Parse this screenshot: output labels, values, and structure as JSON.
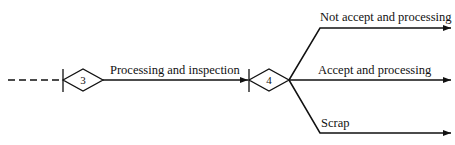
{
  "diagram": {
    "nodes": [
      {
        "id": "3",
        "label": "3"
      },
      {
        "id": "4",
        "label": "4"
      }
    ],
    "edges": [
      {
        "label": "Processing and inspection"
      },
      {
        "label": "Not accept and processing"
      },
      {
        "label": "Accept and processing"
      },
      {
        "label": "Scrap"
      }
    ],
    "colors": {
      "stroke": "#111111",
      "background": "#ffffff"
    }
  }
}
